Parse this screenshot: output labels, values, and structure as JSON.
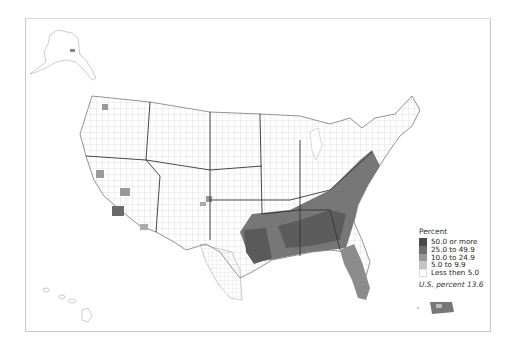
{
  "map": {
    "title_visible": false,
    "legend": {
      "title": "Percent",
      "items": [
        {
          "label": "50.0 or more",
          "color": "#4a4a4a"
        },
        {
          "label": "25.0 to 49.9",
          "color": "#6e6e6e"
        },
        {
          "label": "10.0 to 24.9",
          "color": "#979797"
        },
        {
          "label": "5.0 to 9.9",
          "color": "#c4c4c4"
        },
        {
          "label": "Less then 5.0",
          "color": "#ffffff"
        }
      ],
      "national_note": "U.S. percent 13.6"
    },
    "insets": [
      "Alaska",
      "Hawaii",
      "Puerto Rico"
    ],
    "colors": {
      "border": "#c8c8c8",
      "county_lines": "#bbbbbb",
      "state_lines": "#333333"
    }
  }
}
